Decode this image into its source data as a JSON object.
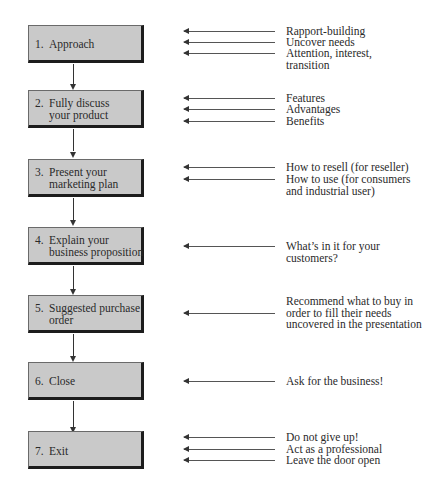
{
  "diagram": {
    "title": "",
    "steps": [
      {
        "num": "1.",
        "label": "Approach",
        "annotations": [
          "Rapport-building",
          "Uncover needs",
          "Attention, interest,\ntransition"
        ]
      },
      {
        "num": "2.",
        "label": "Fully discuss\nyour product",
        "annotations": [
          "Features",
          "Advantages",
          "Benefits"
        ]
      },
      {
        "num": "3.",
        "label": "Present your\nmarketing plan",
        "annotations": [
          "How to resell (for reseller)",
          "How to use (for consumers\nand industrial user)"
        ]
      },
      {
        "num": "4.",
        "label": "Explain your\nbusiness proposition",
        "annotations": [
          "What’s in it for your\ncustomers?"
        ]
      },
      {
        "num": "5.",
        "label": "Suggested purchase\norder",
        "annotations": [
          "Recommend what to buy in\norder to fill their needs\nuncovered in the presentation"
        ]
      },
      {
        "num": "6.",
        "label": "Close",
        "annotations": [
          "Ask for the business!"
        ]
      },
      {
        "num": "7.",
        "label": "Exit",
        "annotations": [
          "Do not give up!",
          "Act as a professional",
          "Leave the door open"
        ]
      }
    ]
  },
  "colors": {
    "box_fill": "#c9c9c9",
    "box_shadow": "#1c1c1c",
    "line": "#333333",
    "text": "#2a2a2a"
  }
}
